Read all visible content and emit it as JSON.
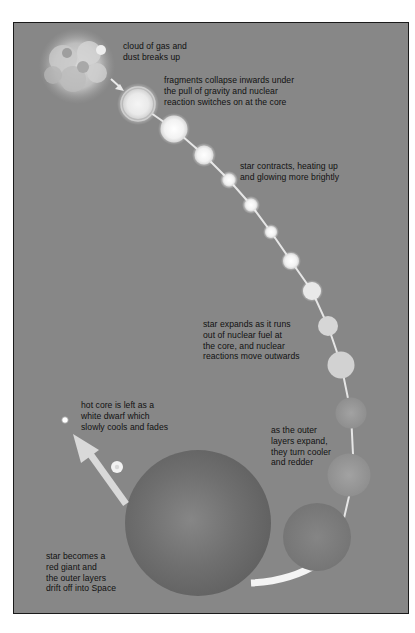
{
  "diagram": {
    "type": "stellar-life-cycle",
    "background_color": "#878787",
    "labels": [
      {
        "id": "cloud",
        "text": "cloud of gas and\ndust breaks up"
      },
      {
        "id": "fragments",
        "text": "fragments collapse inwards under\nthe pull of gravity and nuclear\nreaction switches on at the core"
      },
      {
        "id": "contracts",
        "text": "star contracts, heating up\nand glowing more brightly"
      },
      {
        "id": "expands",
        "text": "star expands as it runs\nout of nuclear fuel at\nthe core, and nuclear\nreactions move outwards"
      },
      {
        "id": "outer-layers",
        "text": "as the outer\nlayers expand,\nthey turn cooler\nand redder"
      },
      {
        "id": "white-dwarf",
        "text": "hot core is left as a\nwhite dwarf which\nslowly cools and fades"
      },
      {
        "id": "red-giant",
        "text": "star becomes a\nred giant and\nthe outer layers\ndrift off into Space"
      }
    ],
    "stages": [
      {
        "name": "gas-cloud"
      },
      {
        "name": "protostar"
      },
      {
        "name": "contracting-star"
      },
      {
        "name": "main-sequence-star"
      },
      {
        "name": "expanding-star"
      },
      {
        "name": "cooling-star"
      },
      {
        "name": "red-giant"
      },
      {
        "name": "white-dwarf"
      }
    ]
  }
}
